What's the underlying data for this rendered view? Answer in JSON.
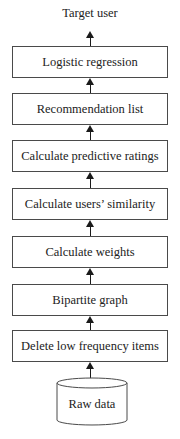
{
  "diagram": {
    "type": "flowchart",
    "direction": "bottom-to-top",
    "output_label": "Target user",
    "steps": [
      {
        "label": "Logistic regression"
      },
      {
        "label": "Recommendation list"
      },
      {
        "label": "Calculate predictive ratings"
      },
      {
        "label": "Calculate users’ similarity"
      },
      {
        "label": "Calculate weights"
      },
      {
        "label": "Bipartite graph"
      },
      {
        "label": "Delete low frequency items"
      }
    ],
    "source": {
      "label": "Raw data",
      "shape": "database-cylinder"
    },
    "colors": {
      "stroke": "#4a4a4a",
      "arrow": "#1a1a1a",
      "text": "#222222",
      "background": "#ffffff"
    }
  }
}
